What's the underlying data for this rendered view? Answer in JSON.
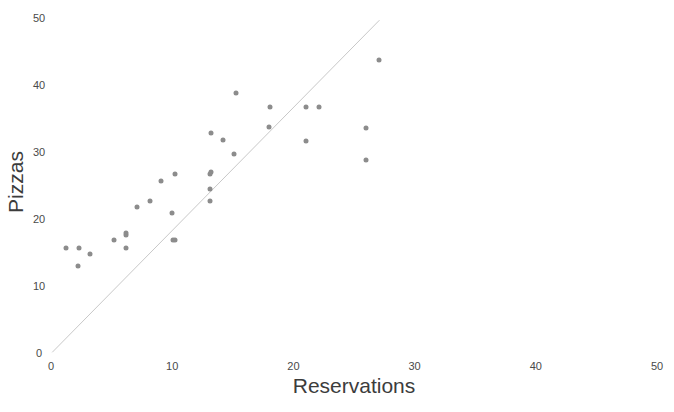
{
  "chart_data": {
    "type": "scatter",
    "title": "",
    "xlabel": "Reservations",
    "ylabel": "Pizzas",
    "xlim": [
      0,
      50
    ],
    "ylim": [
      0,
      50
    ],
    "xticks": [
      0,
      10,
      20,
      30,
      40,
      50
    ],
    "yticks": [
      0,
      10,
      20,
      30,
      40,
      50
    ],
    "xtick_labels": [
      "0",
      "10",
      "20",
      "30",
      "40",
      "50"
    ],
    "ytick_labels": [
      "0",
      "10",
      "20",
      "30",
      "40",
      "50"
    ],
    "grid": false,
    "legend": false,
    "point_color": "#8c8c8c",
    "line_color": "#c8c8c8",
    "background_color": "#ffffff",
    "axis_label_color": "#3c3c3c",
    "points": [
      {
        "x": 1.2,
        "y": 15.6
      },
      {
        "x": 2.3,
        "y": 15.7
      },
      {
        "x": 2.2,
        "y": 12.9
      },
      {
        "x": 3.2,
        "y": 14.7
      },
      {
        "x": 5.2,
        "y": 16.8
      },
      {
        "x": 6.2,
        "y": 17.6
      },
      {
        "x": 6.2,
        "y": 15.6
      },
      {
        "x": 6.2,
        "y": 17.9
      },
      {
        "x": 7.1,
        "y": 21.8
      },
      {
        "x": 8.2,
        "y": 22.7
      },
      {
        "x": 9.1,
        "y": 25.7
      },
      {
        "x": 10.2,
        "y": 26.7
      },
      {
        "x": 10.0,
        "y": 20.8
      },
      {
        "x": 10.2,
        "y": 16.8
      },
      {
        "x": 10.1,
        "y": 16.8
      },
      {
        "x": 13.1,
        "y": 26.7
      },
      {
        "x": 13.1,
        "y": 24.5
      },
      {
        "x": 13.1,
        "y": 22.6
      },
      {
        "x": 13.2,
        "y": 32.8
      },
      {
        "x": 13.2,
        "y": 27.0
      },
      {
        "x": 14.2,
        "y": 31.7
      },
      {
        "x": 15.1,
        "y": 29.7
      },
      {
        "x": 15.3,
        "y": 38.7
      },
      {
        "x": 18.0,
        "y": 33.7
      },
      {
        "x": 18.1,
        "y": 36.7
      },
      {
        "x": 21.0,
        "y": 31.6
      },
      {
        "x": 21.0,
        "y": 36.7
      },
      {
        "x": 22.1,
        "y": 36.7
      },
      {
        "x": 26.0,
        "y": 28.8
      },
      {
        "x": 26.0,
        "y": 33.6
      },
      {
        "x": 27.1,
        "y": 43.6
      }
    ],
    "trend_line": {
      "x0": 0.1,
      "y0": 0.1,
      "x1": 27.1,
      "y1": 49.6
    }
  },
  "axes": {
    "x_title": "Reservations",
    "y_title": "Pizzas"
  }
}
